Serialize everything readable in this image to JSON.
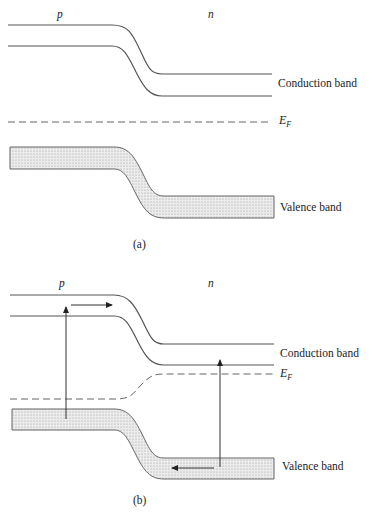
{
  "figure": {
    "panel_a": {
      "region_left_label": "p",
      "region_right_label": "n",
      "conduction_label": "Conduction band",
      "fermi_label": "E",
      "fermi_sub": "F",
      "valence_label": "Valence band",
      "caption": "(a)"
    },
    "panel_b": {
      "region_left_label": "p",
      "region_right_label": "n",
      "conduction_label": "Conduction band",
      "fermi_label": "E",
      "fermi_sub": "F",
      "valence_label": "Valence band",
      "caption": "(b)"
    },
    "colors": {
      "line": "#555555",
      "band_fill": "#e6e6e6"
    }
  }
}
